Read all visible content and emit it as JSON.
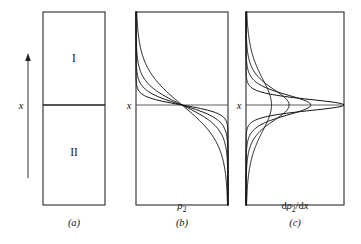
{
  "figure": {
    "background_color": "#ffffff",
    "ink_color": "#131313",
    "width": 361,
    "height": 244
  },
  "panels": [
    {
      "id": "a",
      "caption": "(a)",
      "caption_x": 74,
      "caption_y": 226,
      "frame": {
        "x": 43,
        "y": 12,
        "width": 62,
        "height": 193
      },
      "divider_y": 105,
      "regions": [
        {
          "label": "I",
          "x": 74,
          "y": 62
        },
        {
          "label": "II",
          "x": 74,
          "y": 156
        }
      ],
      "axis_arrow": {
        "label": "x",
        "label_x": 21,
        "label_y": 109,
        "shaft_x": 28,
        "shaft_top": 56,
        "shaft_bottom": 178,
        "head_size": 4
      }
    },
    {
      "id": "b",
      "caption": "(b)",
      "caption_x": 182,
      "caption_y": 226,
      "frame": {
        "x": 136,
        "y": 12,
        "width": 92,
        "height": 193
      },
      "axis_y": 105,
      "axis_label": "x",
      "axis_label_x": 129,
      "axis_label_y": 109,
      "quantity_label": {
        "base": "ρ",
        "sub": "2",
        "x": 182,
        "y": 209
      }
    },
    {
      "id": "c",
      "caption": "(c)",
      "caption_x": 295,
      "caption_y": 226,
      "frame": {
        "x": 246,
        "y": 12,
        "width": 98,
        "height": 193
      },
      "axis_y": 105,
      "axis_label": "x",
      "axis_label_x": 239,
      "axis_label_y": 109,
      "quantity_label": {
        "prefix": "d",
        "base": "ρ",
        "sub": "2",
        "mid": "/d",
        "suffix": "x",
        "x": 295,
        "y": 209
      }
    }
  ],
  "chart_data": {
    "type": "line",
    "xlabel": "x",
    "grid": false,
    "legend": false,
    "panel_b": {
      "type": "line",
      "ylabel": "x",
      "xlabel": "ρ₂",
      "x_is_vertical": true,
      "profile_form": "rho2(x) = 0.5 * (1 - tanh(x / w))",
      "crossing_point": {
        "rho2": 0.5,
        "x": 0
      },
      "xlim": [
        0,
        1
      ],
      "ylim": [
        -1,
        1
      ],
      "series": [
        {
          "name": "w1",
          "interface_width": 0.085,
          "sharpness_rank": 1
        },
        {
          "name": "w2",
          "interface_width": 0.15,
          "sharpness_rank": 2
        },
        {
          "name": "w3",
          "interface_width": 0.235,
          "sharpness_rank": 3
        },
        {
          "name": "w4",
          "interface_width": 0.4,
          "sharpness_rank": 4
        }
      ]
    },
    "panel_c": {
      "type": "line",
      "ylabel": "x",
      "xlabel": "dρ₂/dx",
      "x_is_vertical": true,
      "profile_form": "drho2/dx = -(0.5/w) * sech^2(x / w)",
      "peak_location": {
        "x": 0
      },
      "ylim": [
        -1,
        1
      ],
      "series": [
        {
          "name": "w1",
          "interface_width": 0.085,
          "peak_amplitude": 1.0,
          "peak_rank": 1
        },
        {
          "name": "w2",
          "interface_width": 0.15,
          "peak_amplitude": 0.66,
          "peak_rank": 2
        },
        {
          "name": "w3",
          "interface_width": 0.235,
          "peak_amplitude": 0.44,
          "peak_rank": 3
        },
        {
          "name": "w4",
          "interface_width": 0.4,
          "peak_amplitude": 0.26,
          "peak_rank": 4
        }
      ]
    }
  }
}
